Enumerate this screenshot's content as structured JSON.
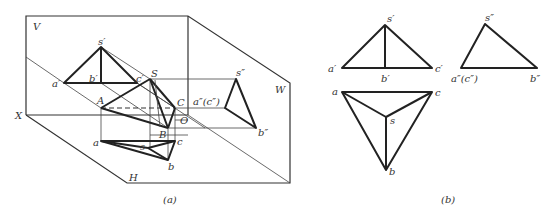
{
  "figure_a": {
    "caption": "(a)",
    "planes": {
      "V": "V",
      "W": "W",
      "H": "H"
    },
    "axis_labels": {
      "X": "X",
      "O": "O"
    },
    "space_points": {
      "S": "S",
      "A": "A",
      "B": "B",
      "C": "C"
    },
    "front_view": {
      "s": "s′",
      "a": "a′",
      "b": "b′",
      "c": "c′"
    },
    "top_view": {
      "s": "s",
      "a": "a",
      "b": "b",
      "c": "c"
    },
    "side_view": {
      "s": "s″",
      "ac": "a″(c″)",
      "b": "b″"
    }
  },
  "figure_b": {
    "caption": "(b)",
    "front_view": {
      "s": "s′",
      "a": "a′",
      "b": "b′",
      "c": "c′"
    },
    "top_view": {
      "s": "s",
      "a": "a",
      "b": "b",
      "c": "c"
    },
    "side_view": {
      "s": "s″",
      "ac": "a″(c″)",
      "b": "b″"
    }
  }
}
